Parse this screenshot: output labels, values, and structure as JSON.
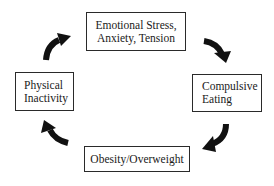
{
  "diagram": {
    "type": "cycle",
    "nodes": [
      {
        "id": "emotional_stress",
        "position": "top",
        "lines": [
          "Emotional Stress,",
          "Anxiety, Tension"
        ]
      },
      {
        "id": "compulsive_eating",
        "position": "right",
        "lines": [
          "Compulsive",
          "Eating"
        ]
      },
      {
        "id": "obesity",
        "position": "bottom",
        "lines": [
          "Obesity/Overweight"
        ]
      },
      {
        "id": "physical_inactivity",
        "position": "left",
        "lines": [
          "Physical",
          "Inactivity"
        ]
      }
    ],
    "edges": [
      {
        "from": "emotional_stress",
        "to": "compulsive_eating",
        "direction": "clockwise"
      },
      {
        "from": "compulsive_eating",
        "to": "obesity",
        "direction": "clockwise"
      },
      {
        "from": "obesity",
        "to": "physical_inactivity",
        "direction": "clockwise"
      },
      {
        "from": "physical_inactivity",
        "to": "emotional_stress",
        "direction": "clockwise"
      }
    ],
    "colors": {
      "border": "#2a2a2a",
      "arrow": "#111111",
      "text": "#1a1a1a",
      "background": "#ffffff"
    }
  }
}
